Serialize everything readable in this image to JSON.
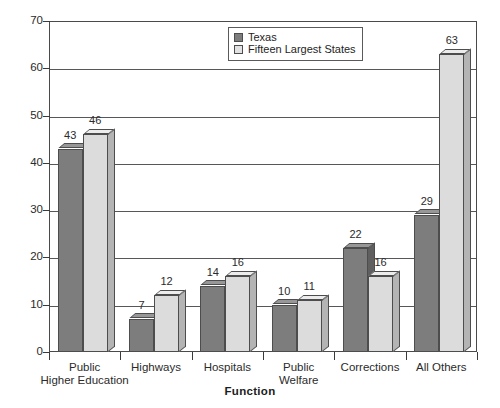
{
  "chart_data": {
    "type": "bar",
    "title": "",
    "subtitle": "",
    "xlabel": "Function",
    "ylabel": "",
    "ylim": [
      0,
      70
    ],
    "yticks": [
      0,
      10,
      20,
      30,
      40,
      50,
      60,
      70
    ],
    "grid": true,
    "legend_position": "top-right",
    "categories": [
      "Public\nHigher Education",
      "Highways",
      "Hospitals",
      "Public\nWelfare",
      "Corrections",
      "All Others"
    ],
    "series": [
      {
        "name": "Texas",
        "color": "#7d7d7d",
        "values": [
          43,
          7,
          14,
          10,
          22,
          29
        ]
      },
      {
        "name": "Fifteen Largest States",
        "color": "#dcdcdc",
        "values": [
          46,
          12,
          16,
          11,
          16,
          63
        ]
      }
    ]
  },
  "legend": {
    "items": [
      {
        "label": "Texas",
        "swatch": "texas"
      },
      {
        "label": "Fifteen Largest States",
        "swatch": "fifteen"
      }
    ]
  },
  "axis": {
    "x_title": "Function",
    "y_tick_labels": [
      "70",
      "60",
      "50",
      "40",
      "30",
      "20",
      "10",
      "0"
    ]
  }
}
